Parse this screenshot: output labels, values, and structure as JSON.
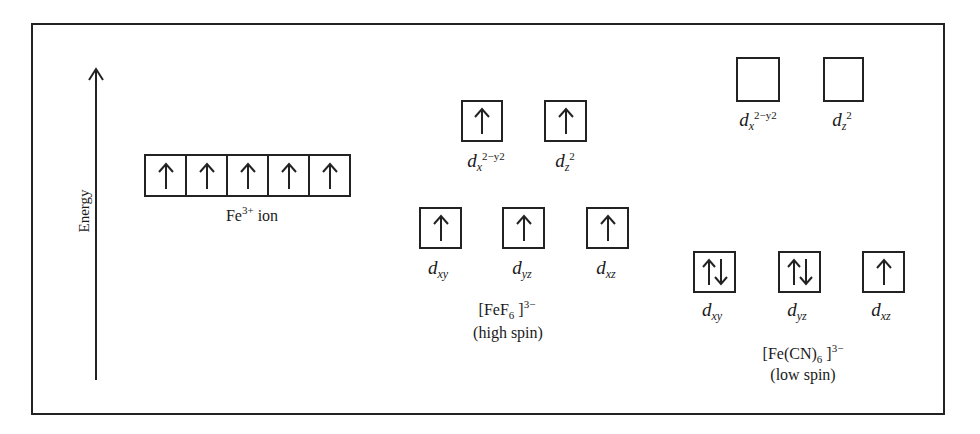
{
  "axis": {
    "label": "Energy"
  },
  "free_ion": {
    "label_main": "Fe",
    "label_sup": "3+",
    "label_tail": " ion",
    "orbitals": [
      {
        "electrons": "up"
      },
      {
        "electrons": "up"
      },
      {
        "electrons": "up"
      },
      {
        "electrons": "up"
      },
      {
        "electrons": "up"
      }
    ]
  },
  "high_spin": {
    "complex_main": "[FeF",
    "complex_sub": "6",
    "complex_close": " ]",
    "complex_charge": "3−",
    "spin_label": "(high spin)",
    "eg": [
      {
        "label": "d",
        "sub": "x",
        "sub2": "2−y2",
        "electrons": "up"
      },
      {
        "label": "d",
        "sub": "z",
        "sub2": "2",
        "electrons": "up"
      }
    ],
    "t2g": [
      {
        "label": "d",
        "sub": "xy",
        "electrons": "up"
      },
      {
        "label": "d",
        "sub": "yz",
        "electrons": "up"
      },
      {
        "label": "d",
        "sub": "xz",
        "electrons": "up"
      }
    ]
  },
  "low_spin": {
    "complex_main": "[Fe(CN)",
    "complex_sub": "6",
    "complex_close": " ]",
    "complex_charge": "3−",
    "spin_label": "(low spin)",
    "eg": [
      {
        "label": "d",
        "sub": "x",
        "sub2": "2−y2",
        "electrons": "empty"
      },
      {
        "label": "d",
        "sub": "z",
        "sub2": "2",
        "electrons": "empty"
      }
    ],
    "t2g": [
      {
        "label": "d",
        "sub": "xy",
        "electrons": "pair"
      },
      {
        "label": "d",
        "sub": "yz",
        "electrons": "pair"
      },
      {
        "label": "d",
        "sub": "xz",
        "electrons": "up"
      }
    ]
  }
}
